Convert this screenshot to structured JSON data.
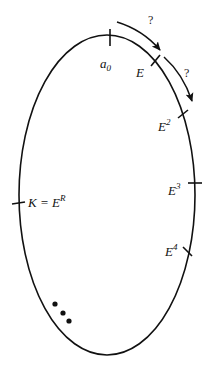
{
  "diagram": {
    "title": "",
    "colors": {
      "stroke": "#111111",
      "background": "#ffffff"
    },
    "ellipse": {
      "cx": 107,
      "cy": 195,
      "rx": 88,
      "ry": 160
    },
    "points": [
      {
        "id": "a0",
        "base": "a",
        "sub": "0",
        "sup": "",
        "position": "top"
      },
      {
        "id": "E",
        "base": "E",
        "sub": "",
        "sup": "",
        "position": "upper-right"
      },
      {
        "id": "E2",
        "base": "E",
        "sub": "",
        "sup": "2",
        "position": "right-upper"
      },
      {
        "id": "E3",
        "base": "E",
        "sub": "",
        "sup": "3",
        "position": "right-middle"
      },
      {
        "id": "E4",
        "base": "E",
        "sub": "",
        "sup": "4",
        "position": "right-lower"
      },
      {
        "id": "K",
        "lhs": "K = ",
        "base": "E",
        "sup": "R",
        "position": "left-middle"
      }
    ],
    "arrows": [
      {
        "from": "a0",
        "to": "E",
        "label": "?"
      },
      {
        "from": "E",
        "to": "E2",
        "label": "?"
      }
    ],
    "ellipsis_dots": "•••",
    "ellipsis_count": 3
  }
}
